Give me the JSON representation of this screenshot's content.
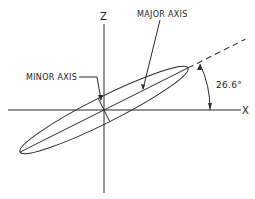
{
  "diagram": {
    "axes": {
      "z_label": "Z",
      "x_label": "X"
    },
    "labels": {
      "major_axis": "MAJOR AXIS",
      "minor_axis": "MINOR AXIS",
      "angle": "26.6°"
    },
    "ellipse": {
      "rotation_deg": 26.6
    },
    "colors": {
      "line": "#2a2a2a",
      "background": "#ffffff"
    }
  }
}
